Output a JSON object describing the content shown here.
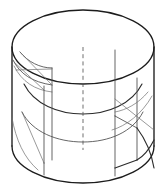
{
  "figure": {
    "object_type": "cylinder-with-slots",
    "projection": "isometric",
    "background_color": "#ffffff",
    "line_color": "#2b2b2b",
    "inner_line_color": "#4a4a4a",
    "axis_color": "#555555",
    "axis_style": "dashed",
    "canvas": {
      "width": 164,
      "height": 196
    },
    "geometry": {
      "top_ellipse": {
        "center_x": 83,
        "center_y": 47,
        "radius_x": 71,
        "radius_y": 37
      },
      "bottom_ellipse": {
        "center_x": 83,
        "center_y": 146,
        "radius_x": 71,
        "radius_y": 37
      },
      "cylinder_height": 99,
      "left_silhouette_x": 12,
      "right_silhouette_x": 154,
      "axis_x": 83,
      "axis_top_y": 47,
      "axis_bottom_y": 150
    },
    "features": [
      {
        "name": "top-rim-ellipse",
        "kind": "full-ellipse",
        "visible": true
      },
      {
        "name": "bottom-rim-arc",
        "kind": "front-arc",
        "visible": true
      },
      {
        "name": "left-slot",
        "kind": "rectangular-slot",
        "side": "left",
        "visible": true
      },
      {
        "name": "right-slot",
        "kind": "rectangular-slot",
        "side": "right",
        "visible": true
      },
      {
        "name": "inner-bore-upper-arc",
        "kind": "hidden-curve",
        "visible": true
      },
      {
        "name": "inner-bore-lower-arc",
        "kind": "hidden-curve",
        "visible": true
      },
      {
        "name": "center-axis",
        "kind": "dashed-centerline",
        "visible": true
      }
    ]
  }
}
